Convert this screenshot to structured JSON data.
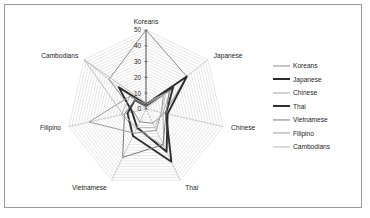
{
  "frame": {
    "border_color": "#9a9a9a",
    "background": "#ffffff"
  },
  "chart_data": {
    "type": "radar",
    "title": "",
    "xlabel": "",
    "ylabel": "",
    "categories": [
      "Koreans",
      "Japanese",
      "Chinese",
      "Thai",
      "Vietnamese",
      "Filipino",
      "Cambodians"
    ],
    "tick_labels": [
      "0",
      "10",
      "20",
      "30",
      "40",
      "50"
    ],
    "ticks": [
      0,
      10,
      20,
      30,
      40,
      50
    ],
    "rlim": [
      0,
      50
    ],
    "grid": true,
    "legend_position": "right",
    "series": [
      {
        "name": "Koreans",
        "color": "#8d8d8d",
        "width": 1.0,
        "values": [
          50,
          33,
          12,
          10,
          9,
          8,
          30
        ]
      },
      {
        "name": "Japanese",
        "color": "#2b2b2b",
        "width": 1.9,
        "values": [
          3,
          33,
          14,
          30,
          13,
          9,
          22
        ]
      },
      {
        "name": "Chinese",
        "color": "#a6a6a6",
        "width": 0.9,
        "values": [
          2,
          20,
          11,
          26,
          14,
          16,
          13
        ]
      },
      {
        "name": "Thai",
        "color": "#303030",
        "width": 1.9,
        "values": [
          2,
          22,
          13,
          37,
          19,
          12,
          9
        ]
      },
      {
        "name": "Vietnamese",
        "color": "#7a7a7a",
        "width": 1.0,
        "values": [
          2,
          19,
          13,
          25,
          34,
          14,
          9
        ]
      },
      {
        "name": "Filipino",
        "color": "#9c9c9c",
        "width": 1.0,
        "values": [
          3,
          14,
          10,
          15,
          17,
          37,
          13
        ]
      },
      {
        "name": "Cambodians",
        "color": "#b8b8b8",
        "width": 0.9,
        "values": [
          4,
          16,
          10,
          13,
          13,
          15,
          50
        ]
      }
    ]
  },
  "legend": {
    "items": [
      {
        "label": "Koreans",
        "color": "#8d8d8d",
        "width": 1.1
      },
      {
        "label": "Japanese",
        "color": "#2b2b2b",
        "width": 2.0
      },
      {
        "label": "Chinese",
        "color": "#a6a6a6",
        "width": 1.0
      },
      {
        "label": "Thai",
        "color": "#303030",
        "width": 2.0
      },
      {
        "label": "Vietnamese",
        "color": "#7a7a7a",
        "width": 1.1
      },
      {
        "label": "Filipino",
        "color": "#9c9c9c",
        "width": 1.1
      },
      {
        "label": "Cambodians",
        "color": "#b8b8b8",
        "width": 1.0
      }
    ]
  }
}
